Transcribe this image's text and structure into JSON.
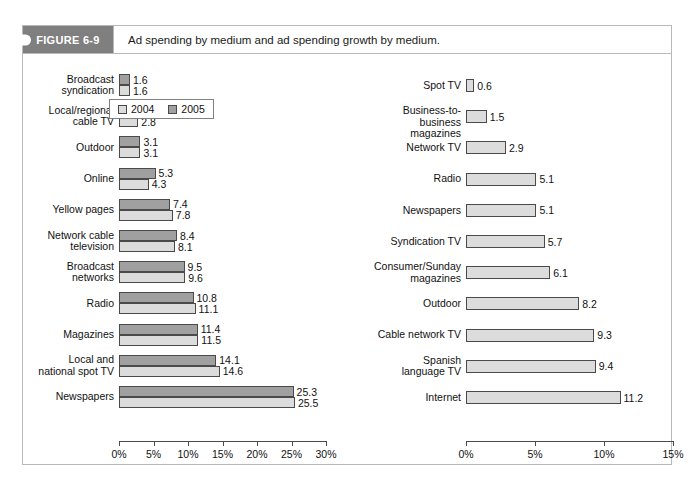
{
  "figure": {
    "badge": "FIGURE 6-9",
    "caption": "Ad spending by medium and ad spending growth by medium."
  },
  "legend": {
    "items": [
      {
        "label": "2004",
        "color": "#dcdcdc",
        "swatch": "legend-swatch-2004"
      },
      {
        "label": "2005",
        "color": "#a0a0a0",
        "swatch": "legend-swatch-2005"
      }
    ]
  },
  "chart_data": [
    {
      "id": "ad-spending-by-medium",
      "type": "bar",
      "orientation": "horizontal",
      "title": "",
      "xlabel": "",
      "ylabel": "",
      "xlim": [
        0,
        30
      ],
      "xticks": [
        0,
        5,
        10,
        15,
        20,
        25,
        30
      ],
      "xtick_labels": [
        "0%",
        "5%",
        "10%",
        "15%",
        "20%",
        "25%",
        "30%"
      ],
      "grid": false,
      "legend_position": "top-center",
      "categories": [
        "Broadcast\nsyndication",
        "Local/regional\ncable TV",
        "Outdoor",
        "Online",
        "Yellow pages",
        "Network cable\ntelevision",
        "Broadcast\nnetworks",
        "Radio",
        "Magazines",
        "Local and\nnational spot TV",
        "Newspapers"
      ],
      "series": [
        {
          "name": "2005",
          "color": "#a0a0a0",
          "values": [
            1.6,
            3.0,
            3.1,
            5.3,
            7.4,
            8.4,
            9.5,
            10.8,
            11.4,
            14.1,
            25.3
          ]
        },
        {
          "name": "2004",
          "color": "#dcdcdc",
          "values": [
            1.6,
            2.8,
            3.1,
            4.3,
            7.8,
            8.1,
            9.6,
            11.1,
            11.5,
            14.6,
            25.5
          ]
        }
      ]
    },
    {
      "id": "ad-spending-growth-by-medium",
      "type": "bar",
      "orientation": "horizontal",
      "title": "",
      "xlabel": "",
      "ylabel": "",
      "xlim": [
        0,
        15
      ],
      "xticks": [
        0,
        5,
        10,
        15
      ],
      "xtick_labels": [
        "0%",
        "5%",
        "10%",
        "15%"
      ],
      "grid": false,
      "legend_position": "none",
      "categories": [
        "Spot TV",
        "Business-to-business\nmagazines",
        "Network TV",
        "Radio",
        "Newspapers",
        "Syndication TV",
        "Consumer/Sunday\nmagazines",
        "Outdoor",
        "Cable network TV",
        "Spanish\nlanguage TV",
        "Internet"
      ],
      "series": [
        {
          "name": "growth",
          "color": "#dcdcdc",
          "values": [
            0.6,
            1.5,
            2.9,
            5.1,
            5.1,
            5.7,
            6.1,
            8.2,
            9.3,
            9.4,
            11.2
          ]
        }
      ]
    }
  ]
}
